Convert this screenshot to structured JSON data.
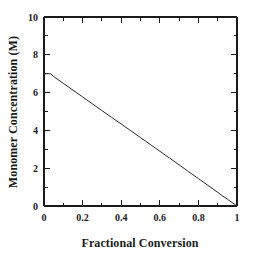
{
  "chart_data": {
    "type": "line",
    "title": "",
    "subtitle": "",
    "xlabel": "Fractional Conversion",
    "ylabel": "Monomer Concentration (M)",
    "xlim": [
      0,
      1
    ],
    "ylim": [
      0,
      10
    ],
    "xticks": [
      0,
      0.2,
      0.4,
      0.6,
      0.8,
      1
    ],
    "xticklabels": [
      "0",
      "0.2",
      "0.4",
      "0.6",
      "0.8",
      "1"
    ],
    "yticks": [
      0,
      2,
      4,
      6,
      8,
      10
    ],
    "yticklabels": [
      "0",
      "2",
      "4",
      "6",
      "8",
      "10"
    ],
    "x_minor_step": 0.1,
    "y_minor_step": 1,
    "grid": false,
    "legend": null,
    "annotations": [],
    "line_color": "#2b2b2b",
    "axis_color": "#1a1a1a",
    "background_color": "#ffffff",
    "series": [
      {
        "name": "Monomer concentration",
        "x": [
          0.0,
          0.01,
          0.02,
          0.035,
          0.05,
          0.1,
          0.15,
          0.2,
          0.25,
          0.3,
          0.35,
          0.4,
          0.45,
          0.5,
          0.55,
          0.6,
          0.65,
          0.7,
          0.75,
          0.8,
          0.85,
          0.9,
          0.95,
          1.0
        ],
        "y": [
          7.0,
          7.0,
          7.0,
          6.99,
          6.85,
          6.49,
          6.13,
          5.77,
          5.41,
          5.05,
          4.69,
          4.34,
          3.98,
          3.62,
          3.26,
          2.9,
          2.54,
          2.18,
          1.81,
          1.45,
          1.09,
          0.72,
          0.36,
          0.0
        ]
      }
    ]
  },
  "axes": {
    "x_title": "Fractional Conversion",
    "y_title": "Monomer Concentration (M)"
  }
}
